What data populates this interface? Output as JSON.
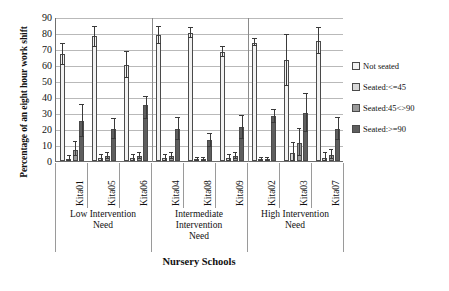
{
  "chart_data": {
    "type": "bar",
    "title": "",
    "xlabel": "Nursery Schools",
    "ylabel": "Percentage of an eight hour work shift",
    "ylim": [
      0,
      90
    ],
    "ytick_step": 10,
    "yticks": [
      "90",
      "80",
      "70",
      "60",
      "50",
      "40",
      "30",
      "20",
      "10",
      "0"
    ],
    "grid": true,
    "legend_position": "right",
    "categories": [
      "Kita01",
      "Kita05",
      "Kita06",
      "Kita04",
      "Kita08",
      "Kita09",
      "Kita02",
      "Kita03",
      "Kita07"
    ],
    "groups": [
      {
        "label": "Low Intervention\nNeed",
        "label_lines": [
          "Low Intervention",
          "Need"
        ],
        "categories": [
          "Kita01",
          "Kita05",
          "Kita06"
        ]
      },
      {
        "label": "Intermediate\nIntervention\nNeed",
        "label_lines": [
          "Intermediate",
          "Intervention",
          "Need"
        ],
        "categories": [
          "Kita04",
          "Kita08",
          "Kita09"
        ]
      },
      {
        "label": "High Intervention\nNeed",
        "label_lines": [
          "High Intervention",
          "Need"
        ],
        "categories": [
          "Kita02",
          "Kita03",
          "Kita07"
        ]
      }
    ],
    "series": [
      {
        "name": "Not seated",
        "color": "#f2f2f2",
        "values": [
          67,
          78,
          60,
          79,
          80,
          68,
          74,
          63,
          75
        ],
        "err_low": [
          7,
          7,
          8,
          6,
          3,
          3,
          2,
          16,
          8
        ],
        "err_high": [
          6,
          6,
          8,
          5,
          3,
          3,
          2,
          16,
          8
        ]
      },
      {
        "name": "Seated:<=45",
        "color": "#d8d8d8",
        "values": [
          1,
          2,
          2,
          2,
          1,
          2,
          1,
          5,
          2
        ],
        "err_low": [
          1,
          2,
          2,
          2,
          1,
          2,
          1,
          5,
          2
        ],
        "err_high": [
          2,
          2,
          2,
          2,
          1,
          2,
          1,
          6,
          3
        ]
      },
      {
        "name": "Seated:45<>90",
        "color": "#9a9a9a",
        "values": [
          7,
          3,
          3,
          3,
          1,
          3,
          1,
          11,
          4
        ],
        "err_low": [
          4,
          2,
          2,
          2,
          1,
          2,
          1,
          8,
          3
        ],
        "err_high": [
          5,
          2,
          2,
          2,
          1,
          2,
          1,
          9,
          3
        ]
      },
      {
        "name": "Seated:>=90",
        "color": "#5e5e5e",
        "values": [
          25,
          20,
          35,
          20,
          13,
          21,
          28,
          30,
          20
        ],
        "err_low": [
          10,
          6,
          9,
          7,
          4,
          7,
          4,
          12,
          7
        ],
        "err_high": [
          10,
          6,
          5,
          7,
          4,
          7,
          4,
          12,
          7
        ]
      }
    ]
  },
  "legend": {
    "items": [
      {
        "label": "Not seated",
        "color": "#f2f2f2"
      },
      {
        "label": "Seated:<=45",
        "color": "#d8d8d8"
      },
      {
        "label": "Seated:45<>90",
        "color": "#9a9a9a"
      },
      {
        "label": "Seated:>=90",
        "color": "#5e5e5e"
      }
    ]
  }
}
